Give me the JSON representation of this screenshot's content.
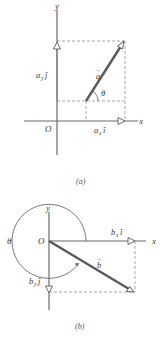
{
  "figure": {
    "panel_a": {
      "caption": "(a)",
      "x_axis_label": "x",
      "y_axis_label": "y",
      "origin_label": "O",
      "vector_label": "a",
      "vector_arrow": "→",
      "angle_label": "θ",
      "x_component": {
        "base": "a",
        "sub": "x",
        "unit": "î"
      },
      "y_component": {
        "base": "a",
        "sub": "y",
        "unit": "ĵ"
      }
    },
    "panel_b": {
      "caption": "(b)",
      "x_axis_label": "x",
      "y_axis_label": "y",
      "origin_label": "O",
      "vector_label": "b",
      "vector_arrow": "→",
      "angle_label": "θ",
      "x_component": {
        "base": "b",
        "sub": "x",
        "unit": "î"
      },
      "y_component": {
        "base": "b",
        "sub": "y",
        "unit": "ĵ"
      }
    },
    "colors": {
      "axis": "#6a6a6a",
      "vector": "#5a5a5a",
      "dashed": "#a8a8a8",
      "text": "#3a3a3a"
    }
  }
}
